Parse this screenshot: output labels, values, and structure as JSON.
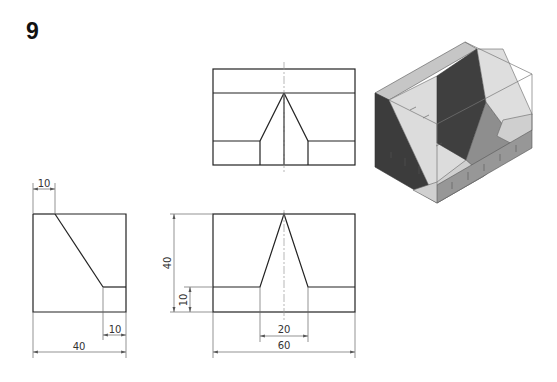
{
  "problem": {
    "number": "9"
  },
  "views": {
    "top_view": {
      "label": "top-view"
    },
    "front_view": {
      "label": "front-view",
      "dimensions": {
        "height": "40",
        "step_height": "10",
        "slot_width": "20",
        "overall_width": "60"
      }
    },
    "side_view": {
      "label": "side-view",
      "dimensions": {
        "top_offset": "10",
        "bottom_step": "10",
        "overall_depth": "40"
      }
    },
    "isometric": {
      "label": "isometric-view"
    }
  },
  "colors": {
    "line": "#222222",
    "dim_line": "#666666",
    "center_line": "#999999",
    "face_dark": "#3a3a3a",
    "face_mid": "#8a8a8a",
    "face_light": "#d4d4d4",
    "face_lighter": "#e6e6e6",
    "face_top": "#c2c2c2"
  }
}
